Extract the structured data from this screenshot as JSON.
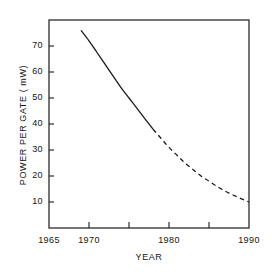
{
  "chart_data": {
    "type": "line",
    "title": "",
    "xlabel": "YEAR",
    "ylabel": "POWER PER GATE ( mW)",
    "xlim": [
      1965,
      1990
    ],
    "ylim": [
      0,
      80
    ],
    "grid": false,
    "legend": null,
    "xticks": [
      1965,
      1970,
      1975,
      1980,
      1985,
      1990
    ],
    "xtick_labels": [
      "1965",
      "1970",
      "",
      "1980",
      "",
      "1990"
    ],
    "yticks": [
      10,
      20,
      30,
      40,
      50,
      60,
      70
    ],
    "ytick_labels": [
      "10",
      "20",
      "30",
      "40",
      "50",
      "60",
      "70"
    ],
    "series": [
      {
        "name": "historical",
        "style": "solid",
        "color": "#1a1a1a",
        "x": [
          1969.0,
          1970.0,
          1971.0,
          1972.0,
          1973.0,
          1974.0,
          1975.0,
          1976.0,
          1977.0,
          1978.0
        ],
        "y": [
          76.0,
          72.0,
          67.5,
          63.0,
          58.5,
          54.0,
          50.0,
          46.0,
          42.0,
          38.0
        ]
      },
      {
        "name": "projected",
        "style": "dashed",
        "color": "#1a1a1a",
        "x": [
          1978.0,
          1979.0,
          1980.0,
          1981.0,
          1982.0,
          1983.0,
          1984.0,
          1985.0,
          1986.0,
          1987.0,
          1988.0,
          1989.0,
          1990.0
        ],
        "y": [
          38.0,
          34.5,
          31.0,
          28.0,
          25.0,
          22.5,
          20.0,
          18.0,
          16.0,
          14.2,
          12.7,
          11.3,
          10.0
        ]
      }
    ]
  },
  "axis_geometry": {
    "plot_left": 49,
    "plot_right": 249,
    "plot_top": 20,
    "plot_bottom": 228
  }
}
